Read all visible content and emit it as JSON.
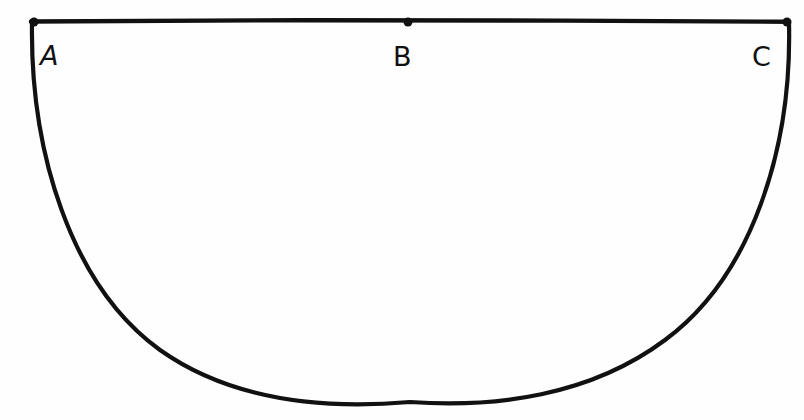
{
  "figure": {
    "background_color": "#fefefe",
    "stroke_color": "#111111",
    "stroke_width": 4,
    "width": 804,
    "height": 420,
    "diameter": {
      "name": "diameter-segment",
      "x1": 31,
      "y1": 21,
      "x2": 789,
      "y2": 21,
      "length": 758
    },
    "arc": {
      "name": "semicircle-arc",
      "center_x": 410,
      "center_y": 21,
      "radius_x": 379,
      "radius_y": 381,
      "lowest_y": 402,
      "direction": "below"
    },
    "points": [
      {
        "id": "A",
        "label": "A",
        "role": "left-endpoint",
        "x": 34,
        "y": 21,
        "dot_radius": 4.5,
        "label_x": 40,
        "label_y": 42,
        "label_style": "slanted"
      },
      {
        "id": "B",
        "label": "B",
        "role": "midpoint",
        "x": 408,
        "y": 21,
        "dot_radius": 4.5,
        "label_x": 393,
        "label_y": 43,
        "label_style": "upright"
      },
      {
        "id": "C",
        "label": "C",
        "role": "right-endpoint",
        "x": 787,
        "y": 21,
        "dot_radius": 4.5,
        "label_x": 752,
        "label_y": 43,
        "label_style": "upright"
      }
    ]
  }
}
